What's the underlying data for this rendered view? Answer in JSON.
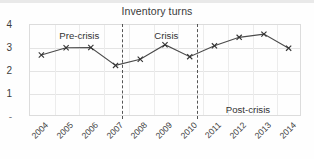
{
  "chart_data": {
    "type": "line",
    "title": "Inventory turns",
    "xlabel": "",
    "ylabel": "",
    "categories": [
      "2004",
      "2005",
      "2006",
      "2007",
      "2008",
      "2009",
      "2010",
      "2011",
      "2012",
      "2013",
      "2014"
    ],
    "values": [
      2.65,
      2.97,
      2.98,
      2.2,
      2.47,
      3.1,
      2.58,
      3.05,
      3.42,
      3.56,
      2.95
    ],
    "series": [
      {
        "name": "Inventory turns",
        "values": [
          2.65,
          2.97,
          2.98,
          2.2,
          2.47,
          3.1,
          2.58,
          3.05,
          3.42,
          3.56,
          2.95
        ]
      }
    ],
    "ylim": [
      0,
      4
    ],
    "yticks": [
      "4",
      "3",
      "2",
      "1",
      "-"
    ],
    "ytick_values": [
      4,
      3,
      2,
      1,
      0
    ],
    "grid": true,
    "legend": false,
    "marker": "x",
    "line_color": "#4a4a4a",
    "grid_color": "#e4e4e4",
    "annotations": [
      {
        "label": "Pre-crisis",
        "x_fraction": 0.185,
        "y_fraction": 0.06
      },
      {
        "label": "Crisis",
        "x_fraction": 0.505,
        "y_fraction": 0.06
      },
      {
        "label": "Post-crisis",
        "x_fraction": 0.805,
        "y_fraction": 0.87
      }
    ],
    "dividers": [
      {
        "name": "pre-crisis-crisis-divider",
        "between": [
          "2007",
          "2008"
        ],
        "x_fraction": 0.342
      },
      {
        "name": "crisis-post-crisis-divider",
        "between": [
          "2010",
          "2011"
        ],
        "x_fraction": 0.618
      }
    ]
  }
}
